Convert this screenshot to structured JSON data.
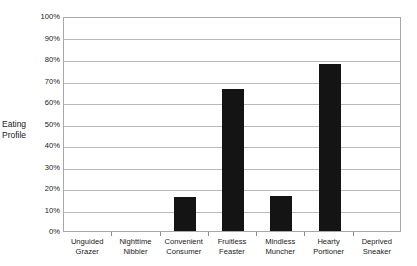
{
  "chart_data": {
    "type": "bar",
    "title": "",
    "xlabel": "",
    "ylabel": "Eating Profile",
    "ylim": [
      0,
      100
    ],
    "ytick_step": 10,
    "grid": true,
    "legend": "none",
    "bar_color": "#141414",
    "categories": [
      "Unguided Grazer",
      "Nighttime Nibbler",
      "Convenient Consumer",
      "Fruitless Feaster",
      "Mindless Muncher",
      "Hearty Portioner",
      "Deprived Sneaker"
    ],
    "category_lines": [
      [
        "Unguided",
        "Grazer"
      ],
      [
        "Nighttime",
        "Nibbler"
      ],
      [
        "Convenient",
        "Consumer"
      ],
      [
        "Fruitless",
        "Feaster"
      ],
      [
        "Mindless",
        "Muncher"
      ],
      [
        "Hearty",
        "Portioner"
      ],
      [
        "Deprived",
        "Sneaker"
      ]
    ],
    "values": [
      0,
      0,
      16,
      66,
      16.5,
      77.5,
      0
    ],
    "ytick_labels": [
      "100%",
      "90%",
      "80%",
      "70%",
      "60%",
      "50%",
      "40%",
      "30%",
      "20%",
      "10%",
      "0%"
    ],
    "ytick_values": [
      100,
      90,
      80,
      70,
      60,
      50,
      40,
      30,
      20,
      10,
      0
    ]
  },
  "axis": {
    "y_title_lines": [
      "Eating",
      "Profile"
    ]
  }
}
